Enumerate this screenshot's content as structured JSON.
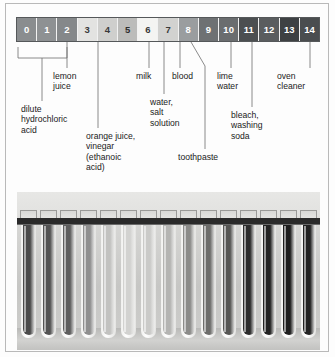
{
  "figure": {
    "type": "diagram"
  },
  "ph_scale": {
    "label": "pH scale",
    "cells": [
      {
        "value": "0",
        "color": "#8a8d8f",
        "text_color": "#ffffff"
      },
      {
        "value": "1",
        "color": "#8e9193",
        "text_color": "#ffffff"
      },
      {
        "value": "2",
        "color": "#85888a",
        "text_color": "#ffffff"
      },
      {
        "value": "3",
        "color": "#e3e3e1",
        "text_color": "#3a3a3a"
      },
      {
        "value": "4",
        "color": "#cfcfcd",
        "text_color": "#3a3a3a"
      },
      {
        "value": "5",
        "color": "#bcbcba",
        "text_color": "#2e2e2e"
      },
      {
        "value": "6",
        "color": "#f4f4f2",
        "text_color": "#3a3a3a"
      },
      {
        "value": "7",
        "color": "#d2d2d0",
        "text_color": "#3a3a3a"
      },
      {
        "value": "8",
        "color": "#9a9d9f",
        "text_color": "#ffffff"
      },
      {
        "value": "9",
        "color": "#6e7173",
        "text_color": "#ffffff"
      },
      {
        "value": "10",
        "color": "#6a6d6f",
        "text_color": "#ffffff"
      },
      {
        "value": "11",
        "color": "#4c4f51",
        "text_color": "#ffffff"
      },
      {
        "value": "12",
        "color": "#5a5d5f",
        "text_color": "#ffffff"
      },
      {
        "value": "13",
        "color": "#3e4143",
        "text_color": "#ffffff"
      },
      {
        "value": "14",
        "color": "#4a4d4f",
        "text_color": "#ffffff"
      }
    ]
  },
  "labels": [
    {
      "id": "dilute-hydrochloric-acid",
      "text": "dilute\nhydrochloric\nacid",
      "x": 21,
      "y": 104,
      "ph": "0-2"
    },
    {
      "id": "lemon-juice",
      "text": "lemon\njuice",
      "x": 53,
      "y": 71,
      "ph": "2"
    },
    {
      "id": "orange-juice-vinegar",
      "text": "orange juice,\nvinegar\n(ethanoic\nacid)",
      "x": 86,
      "y": 131,
      "ph": "3"
    },
    {
      "id": "milk",
      "text": "milk",
      "x": 136,
      "y": 71,
      "ph": "6"
    },
    {
      "id": "water-salt-solution",
      "text": "water,\nsalt\nsolution",
      "x": 150,
      "y": 97,
      "ph": "7"
    },
    {
      "id": "blood",
      "text": "blood",
      "x": 172,
      "y": 71,
      "ph": "7-8"
    },
    {
      "id": "toothpaste",
      "text": "toothpaste",
      "x": 178,
      "y": 152,
      "ph": "8"
    },
    {
      "id": "lime-water",
      "text": "lime\nwater",
      "x": 217,
      "y": 71,
      "ph": "10"
    },
    {
      "id": "bleach-washing-soda",
      "text": "bleach,\nwashing\nsoda",
      "x": 231,
      "y": 110,
      "ph": "11"
    },
    {
      "id": "oven-cleaner",
      "text": "oven\ncleaner",
      "x": 277,
      "y": 71,
      "ph": "14"
    }
  ],
  "photo": {
    "caption": "rack of test tubes showing universal indicator colours for pH 0 to 14",
    "tube_count": 15,
    "tubes": [
      {
        "ph": "0",
        "color": "#4a4a4a"
      },
      {
        "ph": "1",
        "color": "#535353"
      },
      {
        "ph": "2",
        "color": "#5e5e5e"
      },
      {
        "ph": "3",
        "color": "#8f8f8f"
      },
      {
        "ph": "4",
        "color": "#c2c2c0"
      },
      {
        "ph": "5",
        "color": "#d2d2d0"
      },
      {
        "ph": "6",
        "color": "#cacac8"
      },
      {
        "ph": "7",
        "color": "#b4b4b2"
      },
      {
        "ph": "8",
        "color": "#8b8b89"
      },
      {
        "ph": "9",
        "color": "#6d6d6b"
      },
      {
        "ph": "10",
        "color": "#565654"
      },
      {
        "ph": "11",
        "color": "#2c2c2c"
      },
      {
        "ph": "12",
        "color": "#232323"
      },
      {
        "ph": "13",
        "color": "#1d1d1d"
      },
      {
        "ph": "14",
        "color": "#222222"
      }
    ]
  }
}
